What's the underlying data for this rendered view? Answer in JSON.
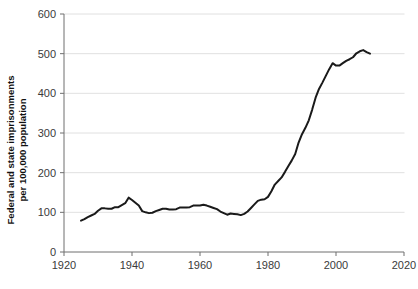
{
  "chart_data": {
    "type": "line",
    "title": "",
    "xlabel": "",
    "ylabel": "Federal and state imprisonments per 100,000 population",
    "ylabel_line1": "Federal and state imprisonments",
    "ylabel_line2": "per 100,000 population",
    "xlim": [
      1920,
      2020
    ],
    "ylim": [
      0,
      600
    ],
    "xticks": [
      1920,
      1940,
      1960,
      1980,
      2000,
      2020
    ],
    "xtick_labels": [
      "1920",
      "1940",
      "1960",
      "1980",
      "2000",
      "2020"
    ],
    "yticks": [
      0,
      100,
      200,
      300,
      400,
      500,
      600
    ],
    "ytick_labels": [
      "0",
      "100",
      "200",
      "300",
      "400",
      "500",
      "600"
    ],
    "grid": "horizontal",
    "legend": "none",
    "line_color": "#1a1a1a",
    "grid_color": "#d8d8d8",
    "axis_color": "#6f6f6f",
    "background_color": "#ffffff",
    "series": [
      {
        "name": "Federal and state imprisonment rate",
        "x": [
          1925,
          1926,
          1927,
          1928,
          1929,
          1930,
          1931,
          1932,
          1933,
          1934,
          1935,
          1936,
          1937,
          1938,
          1939,
          1940,
          1941,
          1942,
          1943,
          1944,
          1945,
          1946,
          1947,
          1948,
          1949,
          1950,
          1951,
          1952,
          1953,
          1954,
          1955,
          1956,
          1957,
          1958,
          1959,
          1960,
          1961,
          1962,
          1963,
          1964,
          1965,
          1966,
          1967,
          1968,
          1969,
          1970,
          1971,
          1972,
          1973,
          1974,
          1975,
          1976,
          1977,
          1978,
          1979,
          1980,
          1981,
          1982,
          1983,
          1984,
          1985,
          1986,
          1987,
          1988,
          1989,
          1990,
          1991,
          1992,
          1993,
          1994,
          1995,
          1996,
          1997,
          1998,
          1999,
          2000,
          2001,
          2002,
          2003,
          2004,
          2005,
          2006,
          2007,
          2008,
          2009,
          2010
        ],
        "y": [
          79,
          83,
          88,
          92,
          96,
          104,
          110,
          110,
          109,
          109,
          113,
          113,
          118,
          123,
          137,
          131,
          124,
          117,
          103,
          100,
          98,
          99,
          103,
          106,
          109,
          109,
          107,
          107,
          108,
          112,
          112,
          112,
          113,
          117,
          117,
          117,
          119,
          117,
          114,
          111,
          108,
          102,
          98,
          94,
          97,
          96,
          95,
          93,
          96,
          102,
          111,
          120,
          129,
          132,
          133,
          139,
          153,
          170,
          179,
          188,
          202,
          217,
          231,
          247,
          276,
          297,
          313,
          332,
          359,
          389,
          411,
          427,
          444,
          461,
          476,
          470,
          470,
          476,
          482,
          486,
          491,
          501,
          506,
          509,
          504,
          500
        ]
      }
    ],
    "annotations": []
  }
}
